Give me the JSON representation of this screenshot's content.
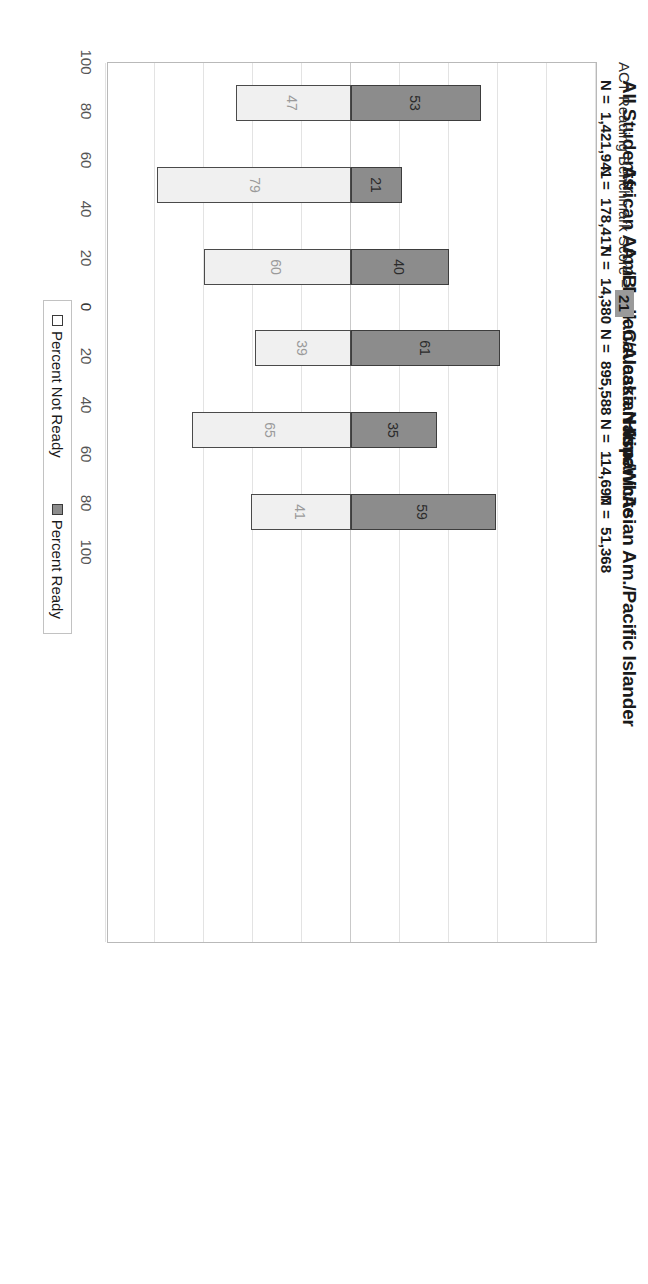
{
  "axis_title": {
    "text": "ACT Reading Benchmark Score =",
    "benchmark": "21"
  },
  "legend": {
    "not_ready": "Percent Not Ready",
    "ready": "Percent Ready"
  },
  "groups": [
    {
      "name": "All Students",
      "n_label": "N =",
      "n_value": "1,421,941",
      "ready_label": "% ready =",
      "ready_value": "53"
    },
    {
      "name": "African Am./Black",
      "n_label": "N =",
      "n_value": "178,417",
      "ready_label": "% ready =",
      "ready_value": "21"
    },
    {
      "name": "Am. Indian/Alaska Native",
      "n_label": "N =",
      "n_value": "14,380",
      "ready_label": "% ready =",
      "ready_value": "40"
    },
    {
      "name": "Caucasian Am./White",
      "n_label": "N =",
      "n_value": "895,588",
      "ready_label": "% ready =",
      "ready_value": "61"
    },
    {
      "name": "Hispanic",
      "n_label": "N =",
      "n_value": "114,697",
      "ready_label": "% ready =",
      "ready_value": "35"
    },
    {
      "name": "Asian Am./Pacific Islander",
      "n_label": "N =",
      "n_value": "51,368",
      "ready_label": "% ready =",
      "ready_value": "59"
    }
  ],
  "colors": {
    "ready_fill": "#8c8c8c",
    "not_ready_fill": "#f0f0f0",
    "bar_border": "#3d3d3d",
    "grid": "#e3e3e3",
    "frame": "#b9b9b9",
    "highlight_box": "#9a9a9a"
  },
  "chart_data": {
    "type": "bar",
    "orientation": "diverging-stacked-vertical",
    "rotation_deg": 90,
    "xlabel": "",
    "ylabel": "",
    "categories": [
      "All Students",
      "African Am./Black",
      "Am. Indian/Alaska Native",
      "Caucasian Am./White",
      "Hispanic",
      "Asian Am./Pacific Islander"
    ],
    "series": [
      {
        "name": "Percent Ready",
        "values": [
          53,
          21,
          40,
          61,
          35,
          59
        ]
      },
      {
        "name": "Percent Not Ready",
        "values": [
          47,
          79,
          60,
          39,
          65,
          41
        ]
      }
    ],
    "n_counts": [
      1421941,
      178417,
      14380,
      895588,
      114697,
      51368
    ],
    "ylim": [
      -100,
      100
    ],
    "yticks": [
      100,
      80,
      60,
      40,
      20,
      0,
      20,
      40,
      60,
      80,
      100
    ],
    "ytick_signed": [
      100,
      80,
      60,
      40,
      20,
      0,
      -20,
      -40,
      -60,
      -80,
      -100
    ],
    "grid": true,
    "legend_position": "bottom",
    "data_labels": true,
    "benchmark_score": 21
  }
}
